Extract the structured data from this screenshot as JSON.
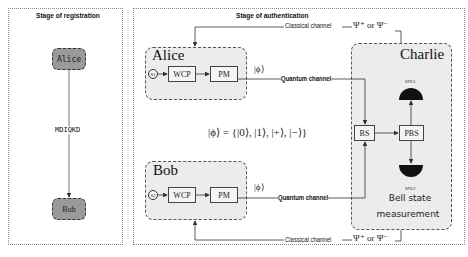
{
  "registration": {
    "title": "Stage of registration",
    "nodes": [
      {
        "label": "Alice"
      },
      {
        "label": "Bob"
      }
    ],
    "link_label": "MDIQKD"
  },
  "authentication": {
    "title": "Stage of authentication",
    "alice": {
      "name": "Alice",
      "source": "S1",
      "components": [
        "WCP",
        "PM"
      ],
      "state": "|ϕ⟩"
    },
    "bob": {
      "name": "Bob",
      "source": "S2",
      "components": [
        "WCP",
        "PM"
      ],
      "state": "|ϕ⟩"
    },
    "charlie": {
      "name": "Charlie",
      "components": [
        "BS",
        "PBS"
      ],
      "detectors": [
        "SPD1",
        "SPD2"
      ],
      "measurement_label_line1": "Bell state",
      "measurement_label_line2": "measurement"
    },
    "channels": {
      "quantum_top": "Quantum channel",
      "quantum_bottom": "Quantum channel",
      "classical_top": "Classical channel",
      "classical_bottom": "Classical channel",
      "classical_top_result": "Ψ⁺ or Ψ⁻",
      "classical_bottom_result": "Ψ⁺ or Ψ⁻"
    },
    "state_set": "|ϕ⟩ = {|0⟩, |1⟩, |+⟩, |−⟩}"
  },
  "colors": {
    "node_fill": "#9a9a9a",
    "party_fill": "#ececec",
    "detector": "#111111",
    "line": "#333333"
  }
}
